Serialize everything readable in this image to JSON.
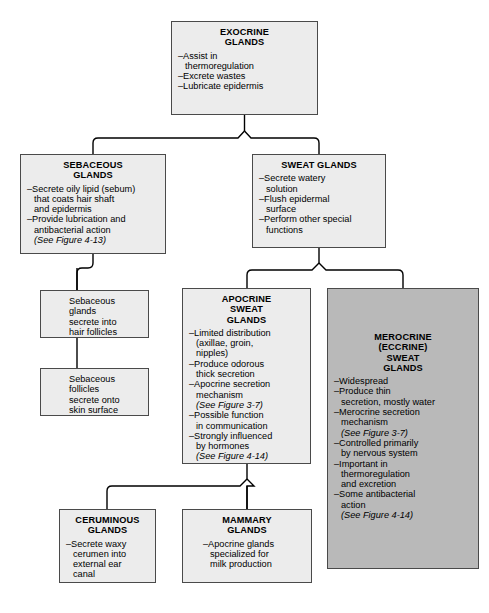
{
  "diagram": {
    "title_text": "Exocrine Glands Classification Flowchart",
    "colors": {
      "box_fill_light": "#ececec",
      "box_fill_shaded": "#b9b9b9",
      "box_border": "#4a4a4a",
      "connector": "#000000",
      "page_background": "#ffffff"
    },
    "nodes": [
      {
        "id": "exocrine",
        "title_lines": [
          "EXOCRINE",
          "GLANDS"
        ],
        "bullets": [
          "–Assist in\n  thermoregulation",
          "–Excrete wastes",
          "–Lubricate epidermis"
        ],
        "shaded": false
      },
      {
        "id": "sebaceous",
        "title_lines": [
          "SEBACEOUS",
          "GLANDS"
        ],
        "bullets": [
          "–Secrete oily lipid (sebum)\n  that coats hair shaft\n  and epidermis",
          "–Provide lubrication and\n  antibacterial action"
        ],
        "italic_note": "(See Figure 4-13)",
        "shaded": false
      },
      {
        "id": "sweat",
        "title_lines": [
          "SWEAT GLANDS"
        ],
        "bullets": [
          "–Secrete watery\n  solution",
          "–Flush epidermal\n  surface",
          "–Perform other special\n  functions"
        ],
        "shaded": false
      },
      {
        "id": "seb-glands",
        "plain_text": "Sebaceous\nglands\nsecrete into\nhair follicles",
        "shaded": false
      },
      {
        "id": "seb-follicles",
        "plain_text": "Sebaceous\nfollicles\nsecrete onto\nskin surface",
        "shaded": false
      },
      {
        "id": "apocrine",
        "title_lines": [
          "APOCRINE",
          "SWEAT",
          "GLANDS"
        ],
        "bullets": [
          "–Limited distribution\n  (axillae, groin,\n  nipples)",
          "–Produce odorous\n  thick secretion",
          "–Apocrine secretion\n  mechanism",
          "(See Figure 3-7)",
          "–Possible function\n  in communication",
          "–Strongly influenced\n  by hormones",
          "(See Figure 4-14)"
        ],
        "italic_indices": [
          3,
          6
        ],
        "shaded": false
      },
      {
        "id": "merocrine",
        "title_lines": [
          "MEROCRINE",
          "(ECCRINE)",
          "SWEAT",
          "GLANDS"
        ],
        "bullets": [
          "–Widespread",
          "–Produce thin\n  secretion, mostly water",
          "–Merocrine secretion\n  mechanism",
          "(See Figure 3-7)",
          "–Controlled primarily\n  by nervous system",
          "–Important in\n  thermoregulation\n  and excretion",
          "–Some antibacterial\n  action",
          "(See Figure 4-14)"
        ],
        "italic_indices": [
          3,
          7
        ],
        "shaded": true
      },
      {
        "id": "ceruminous",
        "title_lines": [
          "CERUMINOUS",
          "GLANDS"
        ],
        "bullets": [
          "–Secrete waxy\n  cerumen into\n  external ear\n  canal"
        ],
        "shaded": false
      },
      {
        "id": "mammary",
        "title_lines": [
          "MAMMARY",
          "GLANDS"
        ],
        "bullets": [
          "–Apocrine glands\n  specialized for\n  milk production"
        ],
        "shaded": false
      }
    ]
  },
  "nodes": {
    "exocrine": {
      "t0": "EXOCRINE",
      "t1": "GLANDS",
      "b0": "–Assist in\n  thermoregulation",
      "b1": "–Excrete wastes",
      "b2": "–Lubricate epidermis"
    },
    "sebaceous": {
      "t0": "SEBACEOUS",
      "t1": "GLANDS",
      "b0": "–Secrete oily lipid (sebum)\n  that coats hair shaft\n  and epidermis",
      "b1": "–Provide lubrication and\n  antibacterial action",
      "b2": "(See Figure 4-13)"
    },
    "sweat": {
      "t0": "SWEAT GLANDS",
      "b0": "–Secrete watery\n  solution",
      "b1": "–Flush epidermal\n  surface",
      "b2": "–Perform other special\n  functions"
    },
    "seb_glands": {
      "text": "Sebaceous\nglands\nsecrete into\nhair follicles"
    },
    "seb_follicles": {
      "text": "Sebaceous\nfollicles\nsecrete onto\nskin surface"
    },
    "apocrine": {
      "t0": "APOCRINE",
      "t1": "SWEAT",
      "t2": "GLANDS",
      "b0": "–Limited distribution\n  (axillae, groin,\n  nipples)",
      "b1": "–Produce odorous\n  thick secretion",
      "b2": "–Apocrine secretion\n  mechanism",
      "b3": "(See Figure 3-7)",
      "b4": "–Possible function\n  in communication",
      "b5": "–Strongly influenced\n  by hormones",
      "b6": "(See Figure 4-14)"
    },
    "merocrine": {
      "t0": "MEROCRINE",
      "t1": "(ECCRINE)",
      "t2": "SWEAT",
      "t3": "GLANDS",
      "b0": "–Widespread",
      "b1": "–Produce thin\n  secretion, mostly water",
      "b2": "–Merocrine secretion\n  mechanism",
      "b3": "(See Figure 3-7)",
      "b4": "–Controlled primarily\n  by nervous system",
      "b5": "–Important in\n  thermoregulation\n  and excretion",
      "b6": "–Some antibacterial\n  action",
      "b7": "(See Figure 4-14)"
    },
    "ceruminous": {
      "t0": "CERUMINOUS",
      "t1": "GLANDS",
      "b0": "–Secrete waxy\n  cerumen into\n  external ear\n  canal"
    },
    "mammary": {
      "t0": "MAMMARY",
      "t1": "GLANDS",
      "b0": "–Apocrine glands\n  specialized for\n  milk production"
    }
  }
}
